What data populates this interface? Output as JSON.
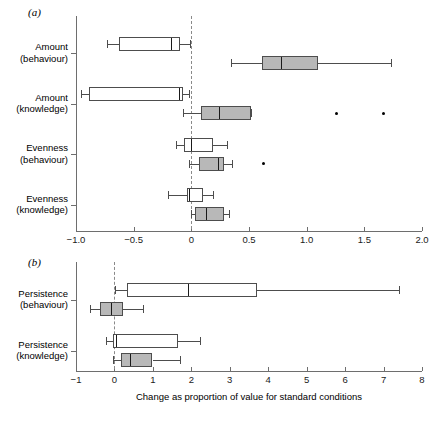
{
  "figure": {
    "panels": [
      {
        "letter": "(a)",
        "categories": [
          "Amount\n(behaviour)",
          "Amount\n(knowledge)",
          "Evenness\n(behaviour)",
          "Evenness\n(knowledge)"
        ],
        "category_labels": [
          [
            "Amount",
            "(behaviour)"
          ],
          [
            "Amount",
            "(knowledge)"
          ],
          [
            "Evenness",
            "(behaviour)"
          ],
          [
            "Evenness",
            "(knowledge)"
          ]
        ],
        "tick_labels": [
          "−1.0",
          "−0.5",
          "0",
          "0.5",
          "1.0",
          "1.5",
          "2.0"
        ],
        "tick_values": [
          -1.0,
          -0.5,
          0,
          0.5,
          1.0,
          1.5,
          2.0
        ],
        "xlim": [
          -1.0,
          2.0
        ],
        "reference_line": 0
      },
      {
        "letter": "(b)",
        "categories": [
          "Persistence\n(behaviour)",
          "Persistence\n(knowledge)"
        ],
        "category_labels": [
          [
            "Persistence",
            "(behaviour)"
          ],
          [
            "Persistence",
            "(knowledge)"
          ]
        ],
        "tick_labels": [
          "−1",
          "0",
          "1",
          "2",
          "3",
          "4",
          "5",
          "6",
          "7",
          "8"
        ],
        "tick_values": [
          -1,
          0,
          1,
          2,
          3,
          4,
          5,
          6,
          7,
          8
        ],
        "xlim": [
          -1,
          8
        ],
        "reference_line": 0,
        "xlabel": "Change as proportion of value for standard conditions"
      }
    ]
  },
  "chart_data": {
    "type": "box",
    "title": "",
    "xlabel": "Change as proportion of value for standard conditions",
    "ylabel": "",
    "grid": false,
    "legend": null,
    "orientation": "horizontal",
    "colors": {
      "series_white": "#ffffff",
      "series_grey": "#b8b8b8",
      "box_edge": "#4d4d4d",
      "median": "#1a1a1a",
      "reference_line": "#8a8a8a",
      "axis": "#6e6e6e",
      "outlier": "#000000"
    },
    "panels": [
      {
        "letter": "(a)",
        "xlim": [
          -1.0,
          2.0
        ],
        "xticks": [
          -1.0,
          -0.5,
          0,
          0.5,
          1.0,
          1.5,
          2.0
        ],
        "reference_line": 0,
        "groups": [
          {
            "category": "Amount (behaviour)",
            "boxes": [
              {
                "series": "white",
                "whisker_low": -0.73,
                "q1": -0.63,
                "median": -0.18,
                "q3": -0.1,
                "whisker_high": -0.01,
                "outliers": []
              },
              {
                "series": "grey",
                "whisker_low": 0.34,
                "q1": 0.61,
                "median": 0.78,
                "q3": 1.1,
                "whisker_high": 1.73,
                "outliers": []
              }
            ]
          },
          {
            "category": "Amount (knowledge)",
            "boxes": [
              {
                "series": "white",
                "whisker_low": -0.96,
                "q1": -0.89,
                "median": -0.11,
                "q3": -0.07,
                "whisker_high": -0.02,
                "outliers": []
              },
              {
                "series": "grey",
                "whisker_low": -0.07,
                "q1": 0.08,
                "median": 0.24,
                "q3": 0.52,
                "whisker_high": 0.52,
                "outliers": [
                  1.26,
                  1.67
                ]
              }
            ]
          },
          {
            "category": "Evenness (behaviour)",
            "boxes": [
              {
                "series": "white",
                "whisker_low": -0.13,
                "q1": -0.06,
                "median": 0.0,
                "q3": 0.19,
                "whisker_high": 0.31,
                "outliers": []
              },
              {
                "series": "grey",
                "whisker_low": -0.02,
                "q1": 0.07,
                "median": 0.23,
                "q3": 0.28,
                "whisker_high": 0.35,
                "outliers": [
                  0.63
                ]
              }
            ]
          },
          {
            "category": "Evenness (knowledge)",
            "boxes": [
              {
                "series": "white",
                "whisker_low": -0.2,
                "q1": -0.04,
                "median": -0.02,
                "q3": 0.1,
                "whisker_high": 0.19,
                "outliers": []
              },
              {
                "series": "grey",
                "whisker_low": 0.0,
                "q1": 0.03,
                "median": 0.13,
                "q3": 0.28,
                "whisker_high": 0.33,
                "outliers": []
              }
            ]
          }
        ]
      },
      {
        "letter": "(b)",
        "xlim": [
          -1,
          8
        ],
        "xticks": [
          -1,
          0,
          1,
          2,
          3,
          4,
          5,
          6,
          7,
          8
        ],
        "reference_line": 0,
        "groups": [
          {
            "category": "Persistence (behaviour)",
            "boxes": [
              {
                "series": "white",
                "whisker_low": 0.01,
                "q1": 0.32,
                "median": 1.92,
                "q3": 3.72,
                "whisker_high": 7.4,
                "outliers": []
              },
              {
                "series": "grey",
                "whisker_low": -0.64,
                "q1": -0.38,
                "median": -0.09,
                "q3": 0.23,
                "whisker_high": 0.75,
                "outliers": []
              }
            ]
          },
          {
            "category": "Persistence (knowledge)",
            "boxes": [
              {
                "series": "white",
                "whisker_low": -0.22,
                "q1": -0.05,
                "median": 0.04,
                "q3": 1.66,
                "whisker_high": 2.22,
                "outliers": []
              },
              {
                "series": "grey",
                "whisker_low": -0.05,
                "q1": 0.17,
                "median": 0.4,
                "q3": 0.99,
                "whisker_high": 1.7,
                "outliers": []
              }
            ]
          }
        ]
      }
    ]
  }
}
